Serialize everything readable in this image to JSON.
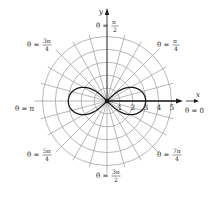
{
  "diagram": {
    "type": "polar-graph",
    "curve": "r^2 = 9 cos(2θ) (lemniscate)",
    "center": {
      "x": 107,
      "y": 101
    },
    "unit_px": 12.9,
    "rings": [
      1,
      2,
      3,
      4,
      5
    ],
    "spoke_step_deg": 15,
    "colors": {
      "grid": "#9a9a9a",
      "curve": "#1a1a1a",
      "axis": "#1a1a1a",
      "text": "#2a2a2a"
    }
  },
  "axes": {
    "x_label": "x",
    "y_label": "y",
    "tick_labels": [
      "1",
      "2",
      "3",
      "4",
      "5"
    ]
  },
  "angle_labels": {
    "theta_0": {
      "prefix": "θ = ",
      "value": "0"
    },
    "theta_pi_4": {
      "prefix": "θ = ",
      "num": "π",
      "den": "4"
    },
    "theta_pi_2": {
      "prefix": "θ = ",
      "num": "π",
      "den": "2"
    },
    "theta_3pi_4": {
      "prefix": "θ = ",
      "num": "3π",
      "den": "4"
    },
    "theta_pi": {
      "prefix": "θ = ",
      "value": "π"
    },
    "theta_5pi_4": {
      "prefix": "θ = ",
      "num": "5π",
      "den": "4"
    },
    "theta_3pi_2": {
      "prefix": "θ = ",
      "num": "3π",
      "den": "2"
    },
    "theta_7pi_4": {
      "prefix": "θ = ",
      "num": "7π",
      "den": "4"
    }
  }
}
